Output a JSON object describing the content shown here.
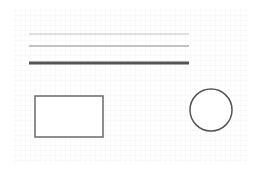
{
  "canvas": {
    "width": 259,
    "height": 175,
    "background": "#ffffff"
  },
  "grid": {
    "x": 12,
    "y": 8,
    "width": 236,
    "height": 157,
    "spacing": 5,
    "color": "#eeeeee"
  },
  "lines": [
    {
      "name": "thin-line",
      "x1": 29,
      "x2": 189,
      "y": 34,
      "stroke": "#c0c0c0",
      "width": 1
    },
    {
      "name": "medium-line",
      "x1": 29,
      "x2": 189,
      "y": 46,
      "stroke": "#8a8a8a",
      "width": 1.2
    },
    {
      "name": "thick-line",
      "x1": 29,
      "x2": 189,
      "y": 63,
      "stroke": "#555555",
      "width": 3
    }
  ],
  "rectangle": {
    "x": 35,
    "y": 96,
    "width": 68,
    "height": 41,
    "stroke": "#6a6a6a",
    "stroke_width": 1.5,
    "fill": "#ffffff"
  },
  "circle": {
    "cx": 211,
    "cy": 110,
    "r": 21,
    "stroke": "#555555",
    "stroke_width": 1.5,
    "fill": "#ffffff"
  }
}
